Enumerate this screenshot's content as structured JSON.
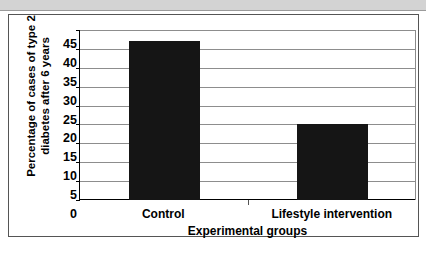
{
  "chart_data": {
    "type": "bar",
    "title": "",
    "subtitle": "",
    "categories": [
      "Control",
      "Lifestyle intervention"
    ],
    "values": [
      42,
      20
    ],
    "xlabel": "Experimental groups",
    "ylabel_line1": "Percentage of cases of type 2",
    "ylabel_line2": "diabetes after 6 years",
    "ylabel": "Percentage of cases of type 2 diabetes after 6 years",
    "ylim": [
      0,
      45
    ],
    "ytick_values": [
      45,
      40,
      35,
      30,
      25,
      20,
      15,
      10,
      5,
      0
    ],
    "ytick_labels": [
      "45",
      "40",
      "35",
      "30",
      "25",
      "20",
      "15",
      "10",
      "5",
      "0"
    ],
    "grid": true,
    "legend": false,
    "bar_color": "#151515",
    "gridline_color": "#8d8d8d",
    "axis_color": "#000000"
  },
  "figure": {
    "background_color": "#ffffff",
    "frame_color": "#555555",
    "topbar_color": "#d3d3d3"
  }
}
